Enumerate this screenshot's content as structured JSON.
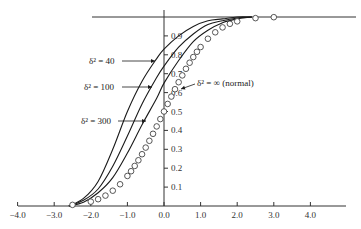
{
  "chart_data": {
    "type": "line",
    "title": "",
    "xlabel": "",
    "ylabel": "",
    "xlim": [
      -4.0,
      5.0
    ],
    "ylim": [
      0,
      1.0
    ],
    "grid": false,
    "x_ticks": [
      "-4.0",
      "-3.0",
      "-2.0",
      "-1.0",
      "0.0",
      "1.0",
      "2.0",
      "3.0",
      "4.0"
    ],
    "x_tick_values": [
      -4,
      -3,
      -2,
      -1,
      0,
      1,
      2,
      3,
      4
    ],
    "y_ticks": [
      "0.1",
      "0.2",
      "0.3",
      "0.4",
      "0.5",
      "0.6",
      "0.7",
      "0.8",
      "0.9"
    ],
    "y_tick_values": [
      0.1,
      0.2,
      0.3,
      0.4,
      0.5,
      0.6,
      0.7,
      0.8,
      0.9
    ],
    "upper_bound_line": 1.0,
    "series": [
      {
        "name": "δ² = 40",
        "style": "solid-line",
        "x": [
          -2.6,
          -2.2,
          -1.8,
          -1.4,
          -1.0,
          -0.6,
          -0.2,
          0.0,
          0.4,
          0.8,
          1.2,
          1.6,
          2.0,
          2.4
        ],
        "values": [
          0.0,
          0.04,
          0.13,
          0.3,
          0.5,
          0.66,
          0.78,
          0.83,
          0.9,
          0.95,
          0.98,
          0.99,
          1.0,
          1.0
        ]
      },
      {
        "name": "δ² = 100",
        "style": "solid-line",
        "x": [
          -2.6,
          -2.2,
          -1.8,
          -1.4,
          -1.0,
          -0.6,
          -0.2,
          0.0,
          0.4,
          0.8,
          1.2,
          1.6,
          2.0,
          2.4
        ],
        "values": [
          0.0,
          0.03,
          0.09,
          0.21,
          0.37,
          0.54,
          0.68,
          0.74,
          0.84,
          0.91,
          0.96,
          0.98,
          0.995,
          1.0
        ]
      },
      {
        "name": "δ² = 300",
        "style": "solid-line",
        "x": [
          -2.6,
          -2.2,
          -1.8,
          -1.4,
          -1.0,
          -0.6,
          -0.2,
          0.0,
          0.4,
          0.8,
          1.2,
          1.6,
          2.0,
          2.4
        ],
        "values": [
          0.0,
          0.02,
          0.07,
          0.15,
          0.28,
          0.43,
          0.57,
          0.65,
          0.77,
          0.87,
          0.93,
          0.97,
          0.99,
          1.0
        ]
      },
      {
        "name": "δ² = ∞ (normal)",
        "style": "open-circles",
        "x": [
          -2.5,
          -2.0,
          -1.8,
          -1.6,
          -1.4,
          -1.2,
          -1.0,
          -0.9,
          -0.8,
          -0.7,
          -0.6,
          -0.5,
          -0.4,
          -0.3,
          -0.2,
          -0.1,
          0.0,
          0.1,
          0.2,
          0.3,
          0.4,
          0.5,
          0.6,
          0.7,
          0.8,
          0.9,
          1.0,
          1.2,
          1.4,
          1.6,
          1.8,
          2.0,
          2.5,
          3.0
        ],
        "values": [
          0.006,
          0.023,
          0.036,
          0.055,
          0.081,
          0.115,
          0.159,
          0.184,
          0.212,
          0.242,
          0.274,
          0.309,
          0.345,
          0.382,
          0.421,
          0.46,
          0.5,
          0.54,
          0.579,
          0.618,
          0.655,
          0.691,
          0.726,
          0.758,
          0.788,
          0.816,
          0.841,
          0.885,
          0.919,
          0.945,
          0.964,
          0.977,
          0.994,
          0.999
        ]
      }
    ],
    "annotations": [
      {
        "text": "δ² = 40",
        "target_series": "δ² = 40"
      },
      {
        "text": "δ² = 100",
        "target_series": "δ² = 100"
      },
      {
        "text": "δ² = 300",
        "target_series": "δ² = 300"
      },
      {
        "text": "δ² = ∞ (normal)",
        "target_series": "δ² = ∞ (normal)"
      }
    ],
    "legend": "none (inline annotations with arrows)"
  },
  "colors": {
    "axis": "#333333",
    "line": "#1a1a1a",
    "marker_stroke": "#444444",
    "background": "#ffffff"
  }
}
